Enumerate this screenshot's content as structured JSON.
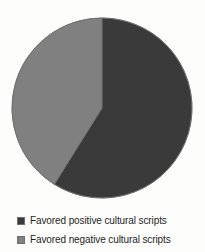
{
  "chart_data": {
    "type": "pie",
    "title": "",
    "categories": [
      "Favored positive cultural scripts",
      "Favored negative cultural scripts"
    ],
    "values": [
      59,
      41
    ],
    "unit": "percent",
    "colors": [
      "#3a3a3a",
      "#808080"
    ],
    "legend_position": "bottom",
    "start_angle_deg": 0,
    "direction": "clockwise",
    "grid": false,
    "slices": [
      {
        "label": "Favored positive cultural scripts",
        "value": 59,
        "color": "#3a3a3a",
        "start_angle_deg": 0,
        "end_angle_deg": 212
      },
      {
        "label": "Favored negative cultural scripts",
        "value": 41,
        "color": "#808080",
        "start_angle_deg": 212,
        "end_angle_deg": 360
      }
    ]
  },
  "legend": {
    "items": [
      {
        "label": "Favored positive cultural scripts",
        "color": "#3a3a3a",
        "swatch_name": "legend-swatch-positive"
      },
      {
        "label": "Favored negative cultural scripts",
        "color": "#808080",
        "swatch_name": "legend-swatch-negative"
      }
    ]
  },
  "figure": {
    "background": "#fdfdfc",
    "outline_color": "#6d6d6d"
  }
}
